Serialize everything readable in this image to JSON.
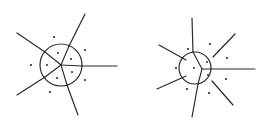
{
  "figure": {
    "panels": [
      {
        "name": "left-voronoi-diagram",
        "inner_cells": 5,
        "outer_sites": 5,
        "radial_edges": 5
      },
      {
        "name": "right-voronoi-diagram",
        "inner_cells": 3,
        "outer_sites": 7,
        "radial_edges": 7
      }
    ],
    "colors": {
      "line": "#2a2a2a",
      "background": "#ffffff"
    }
  }
}
